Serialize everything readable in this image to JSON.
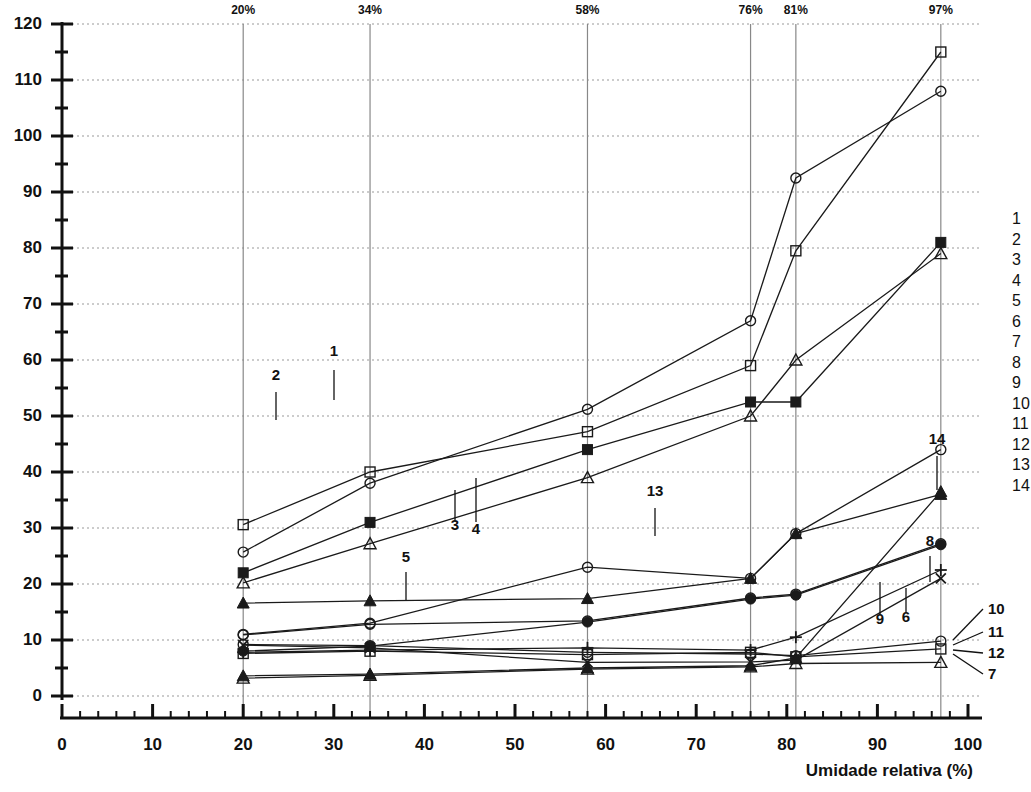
{
  "chart_data": {
    "type": "line",
    "title": "",
    "xlabel": "Umidade relativa (%)",
    "ylabel": "",
    "xlim": [
      0,
      100
    ],
    "ylim": [
      0,
      120
    ],
    "xticks": [
      0,
      10,
      20,
      30,
      40,
      50,
      60,
      70,
      80,
      90,
      100
    ],
    "yticks": [
      0,
      10,
      20,
      30,
      40,
      50,
      60,
      70,
      80,
      90,
      100,
      110,
      120
    ],
    "grid": true,
    "legend_position": "right",
    "top_axis_labels": [
      {
        "x": 20,
        "text": "20%"
      },
      {
        "x": 34,
        "text": "34%"
      },
      {
        "x": 58,
        "text": "58%"
      },
      {
        "x": 76,
        "text": "76%"
      },
      {
        "x": 81,
        "text": "81%"
      },
      {
        "x": 97,
        "text": "97%"
      }
    ],
    "vertical_markers": [
      20,
      34,
      58,
      76,
      81,
      97
    ],
    "x": [
      20,
      34,
      58,
      76,
      81,
      97
    ],
    "series": [
      {
        "name": "1",
        "marker": "open-circle",
        "values": [
          25.7,
          38.0,
          51.2,
          67.0,
          92.5,
          108.0
        ]
      },
      {
        "name": "2",
        "marker": "open-square",
        "values": [
          30.6,
          40.0,
          47.2,
          59.0,
          79.5,
          115.0
        ]
      },
      {
        "name": "3",
        "marker": "filled-square",
        "values": [
          22.0,
          31.0,
          44.0,
          52.5,
          52.5,
          81.0
        ]
      },
      {
        "name": "4",
        "marker": "open-triangle",
        "values": [
          20.2,
          27.2,
          39.0,
          50.0,
          60.0,
          79.0
        ]
      },
      {
        "name": "5",
        "marker": "filled-triangle",
        "values": [
          16.6,
          17.0,
          17.4,
          21.0,
          29.0,
          36.0
        ]
      },
      {
        "name": "6",
        "marker": "open-circle",
        "values": [
          10.9,
          12.8,
          13.4,
          17.5,
          18.2,
          27.2
        ]
      },
      {
        "name": "7",
        "marker": "open-triangle",
        "values": [
          3.2,
          3.7,
          4.8,
          5.2,
          5.8,
          6.0
        ]
      },
      {
        "name": "8",
        "marker": "filled-circle",
        "values": [
          8.0,
          8.9,
          13.2,
          17.3,
          18.0,
          27.0
        ]
      },
      {
        "name": "9",
        "marker": "plus",
        "values": [
          7.8,
          8.2,
          8.6,
          8.2,
          10.5,
          22.5
        ]
      },
      {
        "name": "10",
        "marker": "open-circle",
        "values": [
          9.2,
          9.0,
          7.8,
          7.5,
          7.2,
          9.8
        ]
      },
      {
        "name": "11",
        "marker": "open-square",
        "values": [
          7.6,
          8.0,
          7.4,
          7.8,
          7.0,
          8.4
        ]
      },
      {
        "name": "12",
        "marker": "cross",
        "values": [
          9.1,
          8.6,
          6.0,
          6.1,
          6.4,
          21.0
        ]
      },
      {
        "name": "13",
        "marker": "open-circle",
        "values": [
          11.0,
          13.0,
          23.0,
          21.0,
          29.0,
          44.0
        ]
      },
      {
        "name": "14",
        "marker": "filled-triangle",
        "values": [
          3.6,
          3.9,
          5.0,
          5.4,
          6.8,
          36.5
        ]
      }
    ],
    "callouts": [
      {
        "label": "1",
        "tx": 334,
        "ty": 356,
        "lx": 334,
        "ly": 370,
        "ly2": 400
      },
      {
        "label": "2",
        "tx": 276,
        "ty": 380,
        "lx": 276,
        "ly": 392,
        "ly2": 420
      },
      {
        "label": "3",
        "tx": 455,
        "ty": 530,
        "lx": 455,
        "ly": 520,
        "ly2": 490
      },
      {
        "label": "4",
        "tx": 476,
        "ty": 534,
        "lx": 476,
        "ly": 522,
        "ly2": 478
      },
      {
        "label": "5",
        "tx": 406,
        "ty": 562,
        "lx": 406,
        "ly": 572,
        "ly2": 600
      },
      {
        "label": "6",
        "tx": 906,
        "ty": 622,
        "lx": 906,
        "ly": 612,
        "ly2": 588
      },
      {
        "label": "8",
        "tx": 930,
        "ty": 546,
        "lx": 930,
        "ly": 556,
        "ly2": 582
      },
      {
        "label": "9",
        "tx": 880,
        "ty": 624,
        "lx": 880,
        "ly": 614,
        "ly2": 582
      },
      {
        "label": "13",
        "tx": 655,
        "ty": 496,
        "lx": 655,
        "ly": 508,
        "ly2": 536
      },
      {
        "label": "14",
        "tx": 937,
        "ty": 444,
        "lx": 937,
        "ly": 456,
        "ly2": 490
      }
    ],
    "edge_labels": [
      {
        "label": "10",
        "tx": 988,
        "ty": 614,
        "from_x": 953,
        "from_y": 640
      },
      {
        "label": "11",
        "tx": 988,
        "ty": 637,
        "from_x": 953,
        "from_y": 645
      },
      {
        "label": "12",
        "tx": 988,
        "ty": 658,
        "from_x": 953,
        "from_y": 650
      },
      {
        "label": "7",
        "tx": 988,
        "ty": 679,
        "from_x": 953,
        "from_y": 654
      }
    ],
    "legend_items": [
      "1",
      "2",
      "3",
      "4",
      "5",
      "6",
      "7",
      "8",
      "9",
      "10",
      "11",
      "12",
      "13",
      "14"
    ]
  },
  "colors": {
    "axis": "#111111",
    "grid": "#999999",
    "series": "#1a1a1a",
    "background": "#ffffff"
  }
}
